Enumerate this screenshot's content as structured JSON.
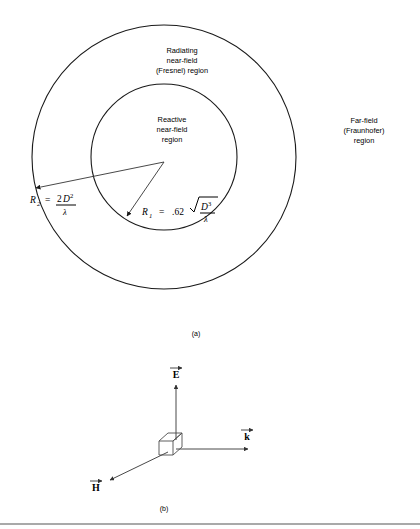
{
  "figure": {
    "panel_a": {
      "caption": "(a)",
      "regions": [
        {
          "name": "radiating-near-field",
          "lines": [
            "Radiating",
            "near-field",
            "(Fresnel) region"
          ]
        },
        {
          "name": "reactive-near-field",
          "lines": [
            "Reactive",
            "near-field",
            "region"
          ]
        },
        {
          "name": "far-field",
          "lines": [
            "Far-field",
            "(Fraunhofer)",
            "region"
          ]
        }
      ],
      "formulas": {
        "r2": {
          "symbol": "R",
          "subscript": "2",
          "equals": "=",
          "numerator_coeff": "2",
          "numerator_var": "D",
          "numerator_exp": "2",
          "denominator": "λ",
          "plain": "R2 = 2D^2 / λ"
        },
        "r1": {
          "symbol": "R",
          "subscript": "1",
          "equals": "=",
          "coefficient": ".62",
          "radicand_var": "D",
          "radicand_exp": "3",
          "denominator": "λ",
          "plain": "R1 = .62 sqrt(D^3 / λ)"
        }
      },
      "geometry": {
        "center_x": 164,
        "center_y": 157,
        "outer_radius": 132,
        "inner_radius": 73
      }
    },
    "panel_b": {
      "caption": "(b)",
      "vectors": [
        {
          "name": "e-field-vector",
          "label": "E",
          "direction": "up"
        },
        {
          "name": "k-wave-vector",
          "label": "k",
          "direction": "right"
        },
        {
          "name": "h-field-vector",
          "label": "H",
          "direction": "down-left"
        }
      ],
      "origin_object": "cube"
    },
    "colors": {
      "stroke": "#1a1a1a",
      "arrow": "#333333",
      "cube": "#4d4d4d",
      "rule": "#555555",
      "background": "#ffffff"
    }
  }
}
